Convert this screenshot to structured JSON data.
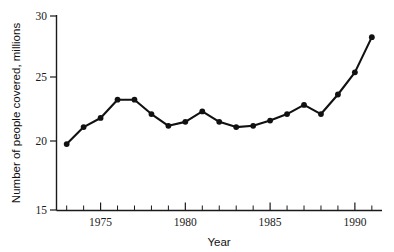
{
  "chart_data": {
    "type": "line",
    "title": "",
    "subtitle": "",
    "xlabel": "Year",
    "ylabel": "Number of people covered, millions",
    "xlim": [
      1972.4,
      1991.6
    ],
    "ylim": [
      15,
      30
    ],
    "grid": false,
    "legend": null,
    "x_major_ticks": [
      1975,
      1980,
      1985,
      1990
    ],
    "x_major_tick_labels": [
      "1975",
      "1980",
      "1985",
      "1990"
    ],
    "x_minor_ticks": [
      1973,
      1974,
      1976,
      1977,
      1978,
      1979,
      1981,
      1982,
      1983,
      1984,
      1986,
      1987,
      1988,
      1989,
      1991
    ],
    "y_ticks": [
      15,
      20,
      25,
      30
    ],
    "y_tick_labels": [
      "15",
      "20",
      "25",
      "30"
    ],
    "marker": "filled-circle",
    "line_color": "#111111",
    "marker_color": "#111111",
    "x": [
      1973,
      1974,
      1975,
      1976,
      1977,
      1978,
      1979,
      1980,
      1981,
      1982,
      1983,
      1984,
      1985,
      1986,
      1987,
      1988,
      1989,
      1990,
      1991
    ],
    "values": [
      20.1,
      21.4,
      22.1,
      23.5,
      23.5,
      22.4,
      21.5,
      21.8,
      22.6,
      21.8,
      21.4,
      21.5,
      21.9,
      22.4,
      23.1,
      22.4,
      23.9,
      25.6,
      28.3
    ],
    "series": [
      {
        "name": "People covered",
        "values": [
          20.1,
          21.4,
          22.1,
          23.5,
          23.5,
          22.4,
          21.5,
          21.8,
          22.6,
          21.8,
          21.4,
          21.5,
          21.9,
          22.4,
          23.1,
          22.4,
          23.9,
          25.6,
          28.3
        ]
      }
    ]
  },
  "axis_labels": {
    "x_title": "Year",
    "y_title": "Number of people covered, millions"
  }
}
